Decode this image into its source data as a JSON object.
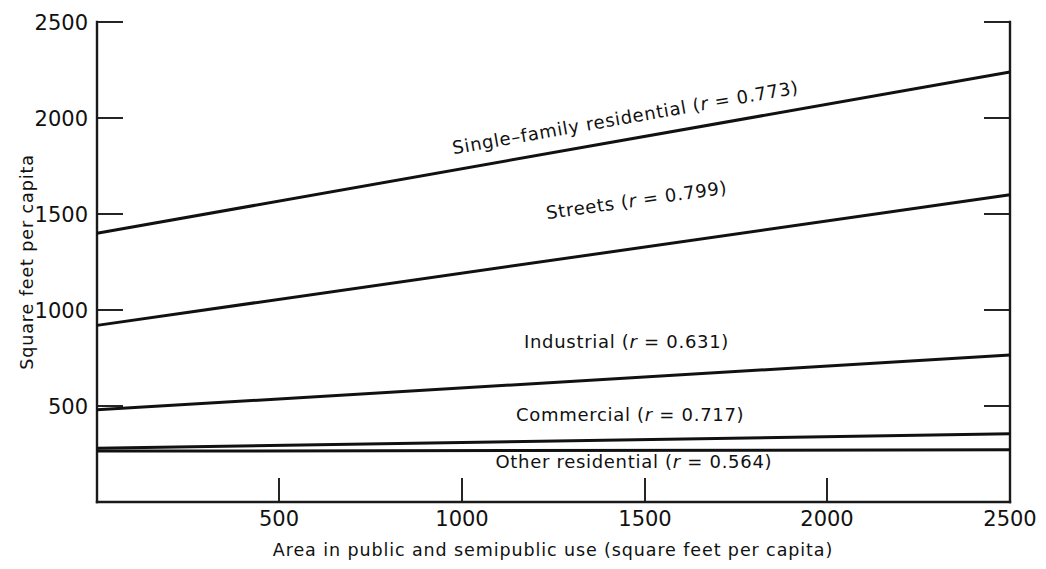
{
  "chart_data": {
    "type": "line",
    "title": "",
    "xlabel": "Area in public and semipublic use (square feet per capita)",
    "ylabel": "Square feet per capita",
    "xlim": [
      0,
      2500
    ],
    "ylim": [
      0,
      2500
    ],
    "grid": false,
    "legend_position": "inline-along-lines",
    "x_ticks": [
      {
        "value": 0,
        "label": ""
      },
      {
        "value": 500,
        "label": "500"
      },
      {
        "value": 1000,
        "label": "1000"
      },
      {
        "value": 1500,
        "label": "1500"
      },
      {
        "value": 2000,
        "label": "2000"
      },
      {
        "value": 2500,
        "label": "2500"
      }
    ],
    "y_ticks": [
      {
        "value": 500,
        "label": "500"
      },
      {
        "value": 1000,
        "label": "1000"
      },
      {
        "value": 1500,
        "label": "1500"
      },
      {
        "value": 2000,
        "label": "2000"
      },
      {
        "value": 2500,
        "label": "2500"
      }
    ],
    "x": [
      0,
      2500
    ],
    "series": [
      {
        "name": "Single-family residential",
        "label_text": "Single–family residential (",
        "label_r_symbol": "r",
        "label_r_value": " = 0.773)",
        "r": 0.773,
        "values": [
          1400,
          2240
        ],
        "label_x": 1450,
        "label_y": 1970,
        "label_rotation": -10.0
      },
      {
        "name": "Streets",
        "label_text": "Streets (",
        "label_r_symbol": "r",
        "label_r_value": " = 0.799)",
        "r": 0.799,
        "values": [
          920,
          1600
        ],
        "label_x": 1480,
        "label_y": 1540,
        "label_rotation": -8.1
      },
      {
        "name": "Industrial",
        "label_text": "Industrial (",
        "label_r_symbol": "r",
        "label_r_value": " = 0.631)",
        "r": 0.631,
        "values": [
          480,
          765
        ],
        "label_x": 1450,
        "label_y": 800,
        "label_rotation": 0
      },
      {
        "name": "Commercial",
        "label_text": "Commercial (",
        "label_r_symbol": "r",
        "label_r_value": " = 0.717)",
        "r": 0.717,
        "values": [
          280,
          355
        ],
        "label_x": 1460,
        "label_y": 420,
        "label_rotation": 0
      },
      {
        "name": "Other residential",
        "label_text": "Other residential (",
        "label_r_symbol": "r",
        "label_r_value": " = 0.564)",
        "r": 0.564,
        "values": [
          265,
          272
        ],
        "label_x": 1470,
        "label_y": 175,
        "label_rotation": 0
      }
    ]
  },
  "axes": {
    "y_title": "Square feet per capita",
    "x_title": "Area in public and semipublic use (square feet per capita)"
  },
  "tick_labels": {
    "y": [
      "2500",
      "2000",
      "1500",
      "1000",
      "500"
    ],
    "x": [
      "500",
      "1000",
      "1500",
      "2000",
      "2500"
    ]
  },
  "series_labels": {
    "single_family": "Single–family residential (r = 0.773)",
    "streets": "Streets (r = 0.799)",
    "industrial": "Industrial (r = 0.631)",
    "commercial": "Commercial (r = 0.717)",
    "other_residential": "Other residential (r = 0.564)"
  },
  "colors": {
    "line": "#111111",
    "axis": "#1a1a1a",
    "background": "#ffffff"
  }
}
